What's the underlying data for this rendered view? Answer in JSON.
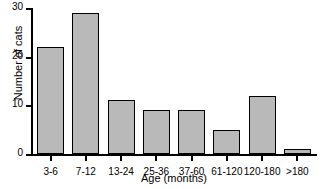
{
  "chart_data": {
    "type": "bar",
    "title": "",
    "xlabel": "Age (months)",
    "ylabel": "Number of cats",
    "categories": [
      "3-6",
      "7-12",
      "13-24",
      "25-36",
      "37-60",
      "61-120",
      "120-180",
      ">180"
    ],
    "values": [
      22,
      29,
      11,
      9,
      9,
      5,
      12,
      1
    ],
    "ylim": [
      0,
      30
    ],
    "yticks": [
      0,
      10,
      20,
      30
    ],
    "ytick_labels": [
      "0",
      "10",
      "20",
      "30"
    ],
    "grid": false,
    "legend": false,
    "bar_fill_color": "#b9b9b9",
    "bar_edge_color": "#000000",
    "axis_color": "#000000",
    "background_color": "#ffffff"
  }
}
